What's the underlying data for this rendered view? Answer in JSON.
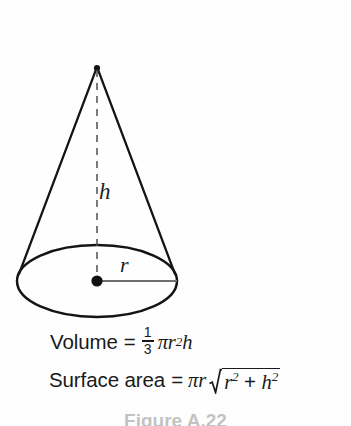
{
  "figure": {
    "shape_name": "cone",
    "height_label": "h",
    "radius_label": "r",
    "geometry": {
      "apex": [
        97,
        66
      ],
      "base_center": [
        97,
        281
      ],
      "base_semi_major_x": 80,
      "base_semi_minor_y": 36,
      "height_line_style": "dashed",
      "radius_line_style": "solid-gray",
      "center_dot": true
    }
  },
  "formulas": {
    "volume": {
      "name": "Volume",
      "equals": "=",
      "fraction_numerator": "1",
      "fraction_denominator": "3",
      "pi": "π",
      "radius_var": "r",
      "radius_exponent": "2",
      "height_var": "h",
      "plain_text": "Volume = 1/3 πr²h"
    },
    "surface_area": {
      "name": "Surface area",
      "equals": "=",
      "pi": "π",
      "radius_var": "r",
      "radicand_first_var": "r",
      "radicand_first_exponent": "2",
      "plus": "+",
      "radicand_second_var": "h",
      "radicand_second_exponent": "2",
      "plain_text": "Surface area = πr√(r² + h²)"
    }
  },
  "caption": {
    "text": "Figure A.22"
  },
  "colors": {
    "background": "#fefefe",
    "ink": "#1a1a1a",
    "radius_line": "#6e6e6e",
    "dashed_line": "#555555"
  }
}
